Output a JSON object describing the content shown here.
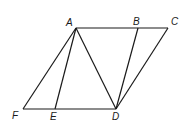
{
  "diagram": {
    "points": {
      "A": {
        "label": "A",
        "x": 76,
        "y": 28,
        "lx": 66,
        "ly": 26
      },
      "B": {
        "label": "B",
        "x": 138,
        "y": 28,
        "lx": 133,
        "ly": 25
      },
      "C": {
        "label": "C",
        "x": 168,
        "y": 28,
        "lx": 171,
        "ly": 25
      },
      "F": {
        "label": "F",
        "x": 23,
        "y": 109,
        "lx": 12,
        "ly": 119
      },
      "E": {
        "label": "E",
        "x": 55,
        "y": 109,
        "lx": 50,
        "ly": 120
      },
      "D": {
        "label": "D",
        "x": 116,
        "y": 109,
        "lx": 112,
        "ly": 120
      }
    },
    "segments": [
      [
        "A",
        "C"
      ],
      [
        "F",
        "D"
      ],
      [
        "A",
        "F"
      ],
      [
        "A",
        "E"
      ],
      [
        "A",
        "D"
      ],
      [
        "B",
        "D"
      ],
      [
        "C",
        "D"
      ]
    ]
  }
}
